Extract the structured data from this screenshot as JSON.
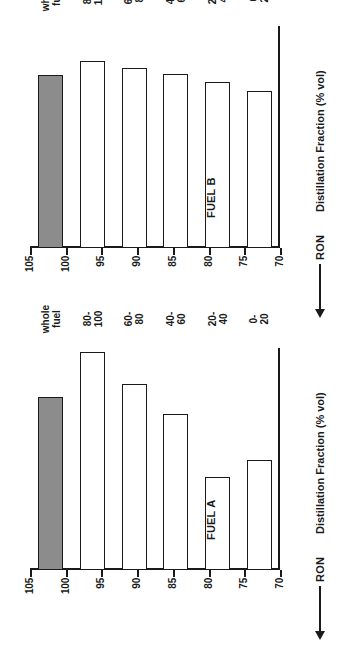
{
  "figure": {
    "orientation": "rotated-90-ccw",
    "value_axis_label": "RON",
    "value_axis_arrow": "left-arrow-icon",
    "category_axis_label": "Distillation Fraction (% vol)",
    "value_ticks": [
      "105",
      "100",
      "95",
      "90",
      "85",
      "80",
      "75",
      "70"
    ],
    "categories": [
      "0-\n20",
      "20-\n40",
      "40-\n60",
      "60-\n80",
      "80-\n100",
      "whole\nfuel"
    ],
    "bar_fill_open": "#ffffff",
    "bar_fill_shaded": "#8c8c8c",
    "axis_color": "#1a1a1a"
  },
  "chart_data": [
    {
      "type": "bar",
      "title": "FUEL A",
      "orientation": "horizontal",
      "xlabel": "Distillation Fraction (% vol)",
      "ylabel": "RON",
      "categories": [
        "0-20",
        "20-40",
        "40-60",
        "60-80",
        "80-100",
        "whole fuel"
      ],
      "category_labels": [
        [
          "0-",
          "20"
        ],
        [
          "20-",
          "40"
        ],
        [
          "40-",
          "60"
        ],
        [
          "60-",
          "80"
        ],
        [
          "80-",
          "100"
        ],
        [
          "whole",
          "fuel"
        ]
      ],
      "values": [
        87.4,
        84.6,
        94.6,
        99.4,
        104.4,
        97.2
      ],
      "bar_styles": [
        "open",
        "open",
        "open",
        "open",
        "open",
        "shaded"
      ],
      "ylim": [
        70,
        105
      ],
      "yticks": [
        70,
        75,
        80,
        85,
        90,
        95,
        100,
        105
      ],
      "grid": false,
      "legend": "none"
    },
    {
      "type": "bar",
      "title": "FUEL B",
      "orientation": "horizontal",
      "xlabel": "Distillation Fraction (% vol)",
      "ylabel": "RON",
      "categories": [
        "0-20",
        "20-40",
        "40-60",
        "60-80",
        "80-100",
        "whole fuel"
      ],
      "category_labels": [
        [
          "0-",
          "20"
        ],
        [
          "20-",
          "40"
        ],
        [
          "40-",
          "60"
        ],
        [
          "60-",
          "80"
        ],
        [
          "80-",
          "100"
        ],
        [
          "whole",
          "fuel"
        ]
      ],
      "values": [
        94.8,
        96.1,
        97.4,
        98.4,
        99.5,
        97.2
      ],
      "bar_styles": [
        "open",
        "open",
        "open",
        "open",
        "open",
        "shaded"
      ],
      "ylim": [
        70,
        105
      ],
      "yticks": [
        70,
        75,
        80,
        85,
        90,
        95,
        100,
        105
      ],
      "grid": false,
      "legend": "none"
    }
  ]
}
